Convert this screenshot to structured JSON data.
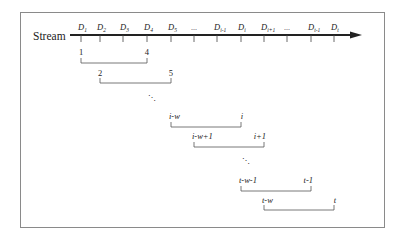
{
  "diagram": {
    "stream_label": "Stream",
    "axis": {
      "x_start": 70,
      "x_end": 362,
      "y": 35,
      "color": "#222222"
    },
    "ticks": [
      {
        "x": 81,
        "main": "D",
        "sub": "1",
        "kind": "label"
      },
      {
        "x": 100,
        "main": "D",
        "sub": "2",
        "kind": "label"
      },
      {
        "x": 123,
        "main": "D",
        "sub": "3",
        "kind": "label"
      },
      {
        "x": 147,
        "main": "D",
        "sub": "4",
        "kind": "label"
      },
      {
        "x": 171,
        "main": "D",
        "sub": "5",
        "kind": "label"
      },
      {
        "x": 194,
        "main": "...",
        "sub": "",
        "kind": "ellipsis"
      },
      {
        "x": 217,
        "main": "D",
        "sub": "i-1",
        "kind": "label"
      },
      {
        "x": 241,
        "main": "D",
        "sub": "i",
        "kind": "label"
      },
      {
        "x": 264,
        "main": "D",
        "sub": "i+1",
        "kind": "label"
      },
      {
        "x": 287,
        "main": "...",
        "sub": "",
        "kind": "ellipsis"
      },
      {
        "x": 311,
        "main": "D",
        "sub": "t-1",
        "kind": "label"
      },
      {
        "x": 334,
        "main": "D",
        "sub": "t",
        "kind": "label"
      }
    ],
    "windows": [
      {
        "x1": 81,
        "x2": 147,
        "label_y": 55,
        "line_y": 63,
        "start": "1",
        "end": "4",
        "italic": false
      },
      {
        "x1": 100,
        "x2": 171,
        "label_y": 76,
        "line_y": 83,
        "start": "2",
        "end": "5",
        "italic": false
      },
      {
        "x1": 171,
        "x2": 241,
        "label_y": 119,
        "line_y": 127,
        "start": "i-w",
        "end": "i",
        "italic": true
      },
      {
        "x1": 194,
        "x2": 264,
        "label_y": 139,
        "line_y": 147,
        "start": "i-w+1",
        "end": "i+1",
        "italic": true
      },
      {
        "x1": 241,
        "x2": 311,
        "label_y": 183,
        "line_y": 191,
        "start": "t-w-1",
        "end": "t-1",
        "italic": true
      },
      {
        "x1": 264,
        "x2": 334,
        "label_y": 203,
        "line_y": 210,
        "start": "t-w",
        "end": "t",
        "italic": true
      }
    ],
    "continuation_dots": [
      {
        "x": 152,
        "y": 100,
        "text": "⋱"
      },
      {
        "x": 246,
        "y": 163,
        "text": "⋱"
      }
    ],
    "colors": {
      "frame": "#8a8a8a",
      "axis": "#222222",
      "bracket": "#555555",
      "text": "#222222"
    }
  }
}
